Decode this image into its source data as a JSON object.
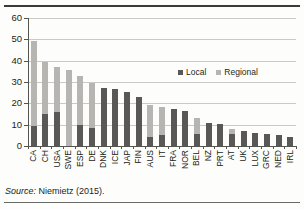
{
  "figure": {
    "source_prefix": "Source:",
    "source_text": " Niemietz (2015)."
  },
  "legend": {
    "position": "top-right-inside",
    "entries": [
      {
        "label": "Local",
        "color": "#595857"
      },
      {
        "label": "Regional",
        "color": "#b6b5b2"
      }
    ]
  },
  "chart_data": {
    "type": "bar",
    "stacked": true,
    "title": "",
    "subtitle": "",
    "xlabel": "",
    "ylabel": "",
    "ylim": [
      0,
      60
    ],
    "yticks": [
      0,
      10,
      20,
      30,
      40,
      50,
      60
    ],
    "ytick_labels": [
      "0",
      "10",
      "20",
      "30",
      "40",
      "50",
      "60"
    ],
    "grid": true,
    "grid_axis": "y",
    "legend_position": "upper right",
    "categories": [
      "CA",
      "CH",
      "USA",
      "SWE",
      "ESP",
      "DE",
      "DNK",
      "ICE",
      "JAP",
      "FIN",
      "AUS",
      "IT",
      "FRA",
      "NOR",
      "BEL",
      "NZ",
      "PRT",
      "AT",
      "UK",
      "LUX",
      "GRC",
      "NED",
      "IRL"
    ],
    "series": [
      {
        "name": "Local",
        "color": "#595857",
        "values": [
          9.2,
          15.2,
          15.8,
          0,
          9.8,
          8.3,
          27.0,
          26.8,
          25.3,
          23.2,
          4.0,
          5.0,
          17.5,
          16.3,
          5.5,
          11.0,
          10.5,
          5.5,
          7.0,
          6.0,
          5.6,
          5.3,
          4.3
        ]
      },
      {
        "name": "Regional",
        "color": "#b6b5b2",
        "values": [
          39.8,
          24.3,
          21.2,
          35.8,
          23.0,
          21.2,
          0,
          0,
          0,
          0,
          15.0,
          13.5,
          0,
          0,
          7.5,
          0,
          0,
          2.5,
          0,
          0,
          0,
          0,
          0
        ]
      }
    ],
    "totals": [
      49.0,
      39.5,
      37.0,
      35.8,
      32.8,
      29.5,
      27.0,
      26.8,
      25.3,
      23.2,
      19.0,
      18.5,
      17.5,
      16.3,
      13.0,
      11.0,
      10.5,
      8.0,
      7.0,
      6.0,
      5.6,
      5.3,
      4.3
    ]
  }
}
